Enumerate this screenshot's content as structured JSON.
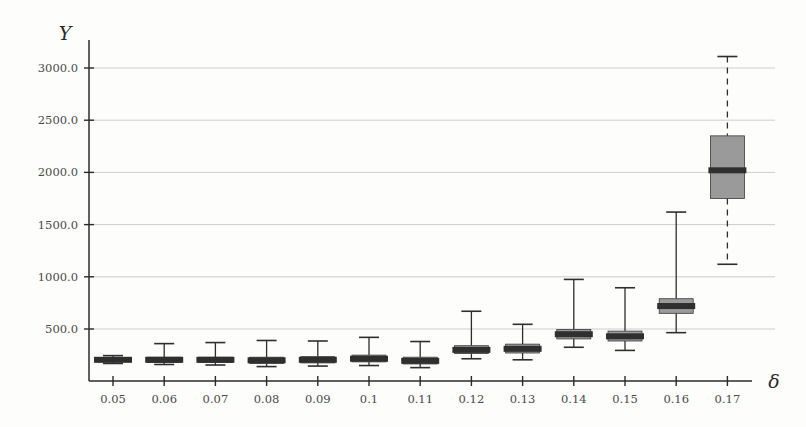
{
  "chart_data": {
    "type": "box",
    "title": "",
    "subtitle": "",
    "xlabel": "δ",
    "ylabel": "Y",
    "grid": true,
    "legend": "none",
    "xlim": [
      0.045,
      0.175
    ],
    "ylim": [
      0,
      3200
    ],
    "y_ticks": [
      "500.0",
      "1000.0",
      "1500.0",
      "2000.0",
      "2500.0",
      "3000.0"
    ],
    "y_tick_values": [
      500,
      1000,
      1500,
      2000,
      2500,
      3000
    ],
    "categories": [
      "0.05",
      "0.06",
      "0.07",
      "0.08",
      "0.09",
      "0.1",
      "0.11",
      "0.12",
      "0.13",
      "0.14",
      "0.15",
      "0.16",
      "0.17"
    ],
    "box_color": "#9a9a9a",
    "median_color": "#2f2f2f",
    "whisker_color": "#2e2e2e",
    "grid_color": "#b9b9b9",
    "axis_color": "#2b2b2b",
    "boxes": [
      {
        "x": "0.05",
        "whisker_low": 170,
        "q1": 185,
        "median": 205,
        "q3": 225,
        "whisker_high": 245
      },
      {
        "x": "0.06",
        "whisker_low": 160,
        "q1": 180,
        "median": 205,
        "q3": 230,
        "whisker_high": 360
      },
      {
        "x": "0.07",
        "whisker_low": 155,
        "q1": 180,
        "median": 205,
        "q3": 230,
        "whisker_high": 370
      },
      {
        "x": "0.08",
        "whisker_low": 140,
        "q1": 170,
        "median": 200,
        "q3": 230,
        "whisker_high": 390
      },
      {
        "x": "0.09",
        "whisker_low": 145,
        "q1": 175,
        "median": 205,
        "q3": 235,
        "whisker_high": 385
      },
      {
        "x": "0.1",
        "whisker_low": 150,
        "q1": 185,
        "median": 215,
        "q3": 250,
        "whisker_high": 420
      },
      {
        "x": "0.11",
        "whisker_low": 130,
        "q1": 165,
        "median": 195,
        "q3": 230,
        "whisker_high": 380
      },
      {
        "x": "0.12",
        "whisker_low": 215,
        "q1": 265,
        "median": 300,
        "q3": 340,
        "whisker_high": 670
      },
      {
        "x": "0.13",
        "whisker_low": 205,
        "q1": 270,
        "median": 310,
        "q3": 355,
        "whisker_high": 545
      },
      {
        "x": "0.14",
        "whisker_low": 325,
        "q1": 405,
        "median": 450,
        "q3": 495,
        "whisker_high": 975
      },
      {
        "x": "0.15",
        "whisker_low": 295,
        "q1": 385,
        "median": 430,
        "q3": 480,
        "whisker_high": 895
      },
      {
        "x": "0.16",
        "whisker_low": 465,
        "q1": 650,
        "median": 720,
        "q3": 790,
        "whisker_high": 1620
      },
      {
        "x": "0.17",
        "whisker_low": 1120,
        "q1": 1750,
        "median": 2020,
        "q3": 2350,
        "whisker_high": 3110
      }
    ]
  }
}
